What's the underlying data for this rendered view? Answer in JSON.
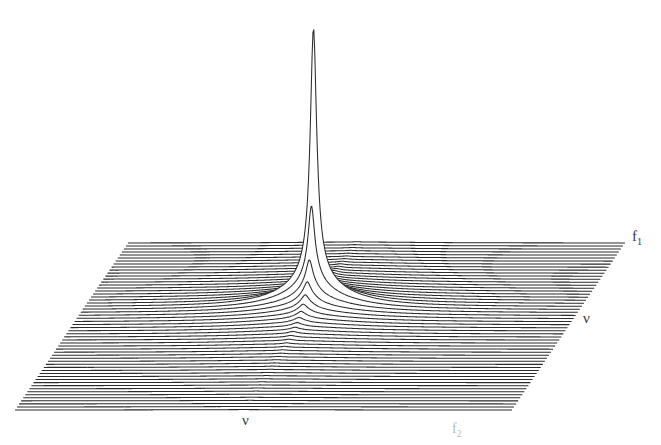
{
  "figure": {
    "type": "stacked-trace-surface-plot",
    "background_color": "#ffffff",
    "line_color": "#2b2b2b",
    "fill_color": "#6f6f6f"
  },
  "labels": {
    "f1": {
      "text": "f",
      "sub": "1",
      "color": "#3a3a3a"
    },
    "f2": {
      "text": "f",
      "sub": "2",
      "color": "#b9b9b9"
    },
    "nu_right": {
      "text": "ν",
      "color": "#3a3a3a"
    },
    "nu_bottom": {
      "text": "ν",
      "color": "#3a3a3a"
    }
  },
  "chart_data": {
    "type": "line",
    "title": "",
    "xlabel": "f2",
    "ylabel": "f1",
    "zlabel": "",
    "grid": false,
    "legend": null,
    "render": "stacked-waterfall",
    "projection": {
      "corners": {
        "back_left": [
          128,
          243
        ],
        "back_right": [
          625,
          243
        ],
        "front_right": [
          512,
          410
        ],
        "front_left": [
          15,
          410
        ]
      },
      "n_traces": 56,
      "row_step_px": 2.98,
      "row_shear_px": -2.02,
      "peak_apex": [
        348,
        8
      ]
    },
    "surface": {
      "function": "2D lorentzian-like resonance with dispersive ridge",
      "x": [
        0.0,
        1.0
      ],
      "y": [
        0.0,
        1.0
      ],
      "peak_position": {
        "x": 0.46,
        "y": 0.62
      },
      "peak_height_px": 236,
      "peak_halfwidth_x": 0.0075,
      "peak_halfwidth_y": 0.012,
      "ridge_halfwidth_x": 0.075,
      "ridge_halfwidth_y": 0.075,
      "ridge_amplitude_frac": 0.085,
      "negative_lobe_amplitude_frac": -0.018
    },
    "axis_ranges": {
      "f2": [
        0,
        1
      ],
      "f1": [
        0,
        1
      ],
      "intensity": [
        -0.02,
        1.0
      ]
    }
  }
}
